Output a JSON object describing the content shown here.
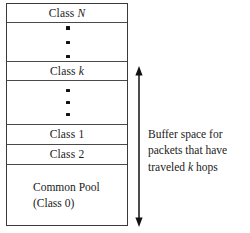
{
  "figure": {
    "stack": {
      "name": "buffer-stack",
      "bands": [
        {
          "id": "class-n",
          "kind": "label",
          "text_prefix": "Class ",
          "text_italic": "N",
          "text_suffix": ""
        },
        {
          "id": "ellipsis-top",
          "kind": "dots",
          "dot_count": 3
        },
        {
          "id": "class-k",
          "kind": "label",
          "text_prefix": "Class ",
          "text_italic": "k",
          "text_suffix": ""
        },
        {
          "id": "ellipsis-mid",
          "kind": "dots",
          "dot_count": 3
        },
        {
          "id": "class-1",
          "kind": "label",
          "text_prefix": "Class 1",
          "text_italic": "",
          "text_suffix": ""
        },
        {
          "id": "class-2",
          "kind": "label",
          "text_prefix": "Class 2",
          "text_italic": "",
          "text_suffix": ""
        },
        {
          "id": "common-pool",
          "kind": "pool",
          "line1": "Common Pool",
          "line2": "(Class 0)"
        }
      ]
    },
    "annotation": {
      "arrow": {
        "name": "double-headed-arrow",
        "direction": "both"
      },
      "caption_line1": "Buffer space for",
      "caption_line2": "packets that have",
      "caption_line3_prefix": "traveled ",
      "caption_line3_italic": "k",
      "caption_line3_suffix": " hops"
    },
    "colors": {
      "background": "#ffffff",
      "outline": "#3a3a3a",
      "divider": "#4a4a4a",
      "text": "#1a1a1a",
      "dot": "#111111",
      "arrow": "#111111"
    }
  }
}
